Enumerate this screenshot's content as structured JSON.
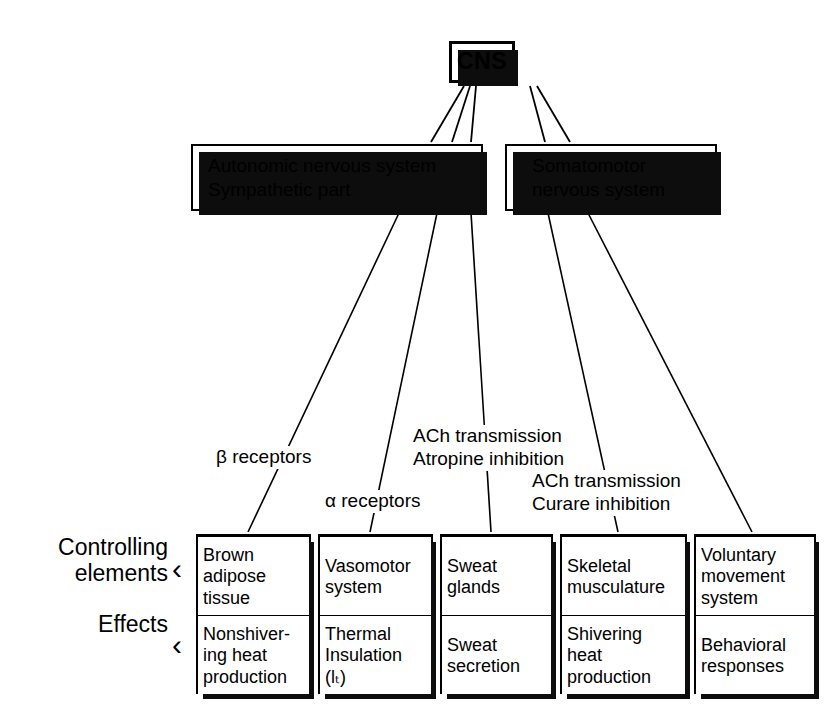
{
  "diagram": {
    "ink_color": "#000000",
    "background_color": "#ffffff"
  },
  "top": {
    "cns_label": "CNS"
  },
  "systems": [
    {
      "id": "autonomic",
      "label": "Autonomic nervous system\nSympathetic part"
    },
    {
      "id": "somatomotor",
      "label": "Somatomotor\nnervous system"
    }
  ],
  "annotations": [
    {
      "id": "beta-receptors",
      "label": "β receptors"
    },
    {
      "id": "alpha-receptors",
      "label": "α receptors"
    },
    {
      "id": "ach-atropine",
      "label": "ACh transmission\nAtropine inhibition"
    },
    {
      "id": "ach-curare",
      "label": "ACh transmission\nCurare inhibition"
    }
  ],
  "row_labels": {
    "controlling_elements": "Controlling\nelements",
    "effects": "Effects",
    "bracket_glyph": "‹"
  },
  "effectors": [
    {
      "controlling_element": "Brown\nadipose\ntissue",
      "effect": "Nonshiver-\ning heat\nproduction"
    },
    {
      "controlling_element": "Vasomotor\nsystem",
      "effect": "Thermal\nInsulation\n(lₜ)"
    },
    {
      "controlling_element": "Sweat\nglands",
      "effect": "Sweat\nsecretion"
    },
    {
      "controlling_element": "Skeletal\nmusculature",
      "effect": "Shivering\nheat\nproduction"
    },
    {
      "controlling_element": "Voluntary\nmovement\nsystem",
      "effect": "Behavioral\nresponses"
    }
  ]
}
